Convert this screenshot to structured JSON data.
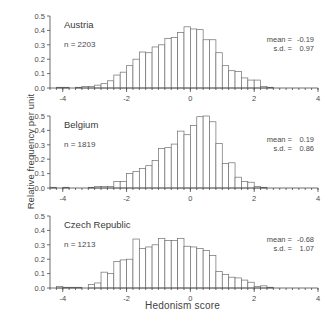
{
  "chart_data": {
    "type": "bar",
    "title": "",
    "xlabel": "Hedonism score",
    "ylabel": "Relative frequency per unit",
    "xlim": [
      -4.4,
      4.0
    ],
    "ylim": [
      0.0,
      0.5
    ],
    "grid": false,
    "legend": "none",
    "bin_width": 0.2,
    "x_ticks": [
      -4,
      -2,
      0,
      2,
      4
    ],
    "x_tick_labels": [
      "-4",
      "-2",
      "0",
      "2",
      "4"
    ],
    "y_ticks": [
      0.0,
      0.1,
      0.2,
      0.3,
      0.4,
      0.5
    ],
    "y_tick_labels": [
      "0.0",
      "0.1",
      "0.2",
      "0.3",
      "0.4",
      "0.5"
    ],
    "panels": [
      {
        "name": "Austria",
        "n_label": "n = 2203",
        "mean_label": "mean =",
        "mean_value": "-0.19",
        "sd_label": "s.d. =",
        "sd_value": "0.97",
        "bin_left_edges": [
          -4.4,
          -4.2,
          -4.0,
          -3.8,
          -3.6,
          -3.4,
          -3.2,
          -3.0,
          -2.8,
          -2.6,
          -2.4,
          -2.2,
          -2.0,
          -1.8,
          -1.6,
          -1.4,
          -1.2,
          -1.0,
          -0.8,
          -0.6,
          -0.4,
          -0.2,
          0.0,
          0.2,
          0.4,
          0.6,
          0.8,
          1.0,
          1.2,
          1.4,
          1.6,
          1.8,
          2.0,
          2.2,
          2.4,
          2.6,
          2.8,
          3.0
        ],
        "values": [
          0.0,
          0.005,
          0.005,
          0.0,
          0.005,
          0.01,
          0.01,
          0.02,
          0.03,
          0.05,
          0.09,
          0.11,
          0.155,
          0.2,
          0.25,
          0.245,
          0.285,
          0.3,
          0.345,
          0.35,
          0.385,
          0.425,
          0.41,
          0.405,
          0.335,
          0.335,
          0.245,
          0.155,
          0.12,
          0.115,
          0.07,
          0.055,
          0.055,
          0.01,
          0.005,
          0.0,
          0.0,
          0.0
        ]
      },
      {
        "name": "Belgium",
        "n_label": "n = 1819",
        "mean_label": "mean =",
        "mean_value": "0.19",
        "sd_label": "s.d. =",
        "sd_value": "0.86",
        "bin_left_edges": [
          -4.4,
          -4.2,
          -4.0,
          -3.8,
          -3.6,
          -3.4,
          -3.2,
          -3.0,
          -2.8,
          -2.6,
          -2.4,
          -2.2,
          -2.0,
          -1.8,
          -1.6,
          -1.4,
          -1.2,
          -1.0,
          -0.8,
          -0.6,
          -0.4,
          -0.2,
          0.0,
          0.2,
          0.4,
          0.6,
          0.8,
          1.0,
          1.2,
          1.4,
          1.6,
          1.8,
          2.0,
          2.2,
          2.4,
          2.6,
          2.8,
          3.0
        ],
        "values": [
          0.005,
          0.0,
          0.005,
          0.0,
          0.0,
          0.0,
          0.005,
          0.01,
          0.01,
          0.01,
          0.045,
          0.045,
          0.1,
          0.115,
          0.135,
          0.155,
          0.19,
          0.275,
          0.28,
          0.305,
          0.395,
          0.37,
          0.435,
          0.495,
          0.5,
          0.46,
          0.31,
          0.17,
          0.175,
          0.075,
          0.045,
          0.04,
          0.01,
          0.005,
          0.0,
          0.0,
          0.0,
          0.0
        ]
      },
      {
        "name": "Czech Republic",
        "n_label": "n = 1213",
        "mean_label": "mean =",
        "mean_value": "-0.68",
        "sd_label": "s.d. =",
        "sd_value": "1.07",
        "bin_left_edges": [
          -4.4,
          -4.2,
          -4.0,
          -3.8,
          -3.6,
          -3.4,
          -3.2,
          -3.0,
          -2.8,
          -2.6,
          -2.4,
          -2.2,
          -2.0,
          -1.8,
          -1.6,
          -1.4,
          -1.2,
          -1.0,
          -0.8,
          -0.6,
          -0.4,
          -0.2,
          0.0,
          0.2,
          0.4,
          0.6,
          0.8,
          1.0,
          1.2,
          1.4,
          1.6,
          1.8,
          2.0,
          2.2,
          2.4,
          2.6,
          2.8,
          3.0
        ],
        "values": [
          0.0,
          0.01,
          0.005,
          0.005,
          0.005,
          0.0,
          0.025,
          0.035,
          0.11,
          0.1,
          0.185,
          0.195,
          0.2,
          0.34,
          0.275,
          0.285,
          0.3,
          0.345,
          0.33,
          0.33,
          0.345,
          0.29,
          0.285,
          0.275,
          0.26,
          0.225,
          0.115,
          0.095,
          0.075,
          0.07,
          0.055,
          0.04,
          0.01,
          0.015,
          0.005,
          0.0,
          0.0,
          0.0
        ]
      }
    ]
  }
}
